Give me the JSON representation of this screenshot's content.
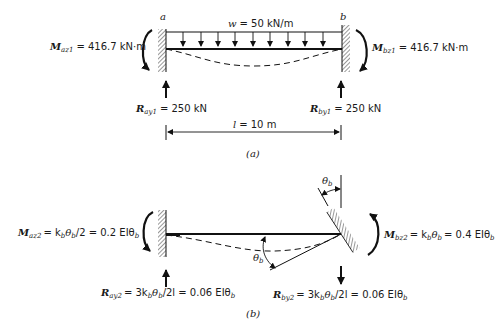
{
  "figure_a": {
    "caption": "(a)",
    "node_a_label": "a",
    "node_b_label": "b",
    "load": {
      "symbol": "w",
      "value": "= 50 kN/m"
    },
    "moment_a": {
      "symbol": "M",
      "subscript": "az1",
      "value": "= 416.7 kN·m"
    },
    "moment_b": {
      "symbol": "M",
      "subscript": "bz1",
      "value": "= 416.7 kN·m"
    },
    "reaction_a": {
      "symbol": "R",
      "subscript": "ay1",
      "value": "= 250 kN"
    },
    "reaction_b": {
      "symbol": "R",
      "subscript": "by1",
      "value": "= 250 kN"
    },
    "span": {
      "symbol": "l",
      "value": "= 10 m"
    }
  },
  "figure_b": {
    "caption": "(b)",
    "moment_a": {
      "symbol": "M",
      "subscript": "az2",
      "expr": "= k",
      "expr_sub": "b",
      "expr2": "θ",
      "expr2_sub": "b",
      "tail": "/2 = 0.2 EIθ",
      "tail_sub": "b"
    },
    "moment_b": {
      "symbol": "M",
      "subscript": "bz2",
      "expr": "= k",
      "expr_sub": "b",
      "expr2": "θ",
      "expr2_sub": "b",
      "tail": "= 0.4 EIθ",
      "tail_sub": "b"
    },
    "reaction_a": {
      "symbol": "R",
      "subscript": "ay2",
      "expr": "= 3k",
      "expr_sub": "b",
      "expr2": "θ",
      "expr2_sub": "b",
      "tail": "/2l = 0.06 EIθ",
      "tail_sub": "b"
    },
    "reaction_b": {
      "symbol": "R",
      "subscript": "by2",
      "expr": "= 3k",
      "expr_sub": "b",
      "expr2": "θ",
      "expr2_sub": "b",
      "tail": "/2l = 0.06 EIθ",
      "tail_sub": "b"
    },
    "theta_top": {
      "symbol": "θ",
      "subscript": "b"
    },
    "theta_left": {
      "symbol": "θ",
      "subscript": "b"
    }
  }
}
